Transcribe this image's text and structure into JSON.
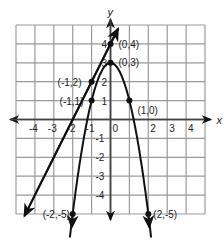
{
  "chart_data": {
    "type": "line",
    "title": "",
    "xlabel": "x",
    "ylabel": "y",
    "xlim": [
      -5,
      5
    ],
    "ylim": [
      -5,
      5
    ],
    "grid": true,
    "x_ticks": [
      "-4",
      "-3",
      "-2",
      "-1",
      "0",
      "2",
      "3",
      "4"
    ],
    "y_ticks": [
      "4",
      "3",
      "2",
      "1",
      "-1",
      "-2",
      "-3",
      "-4"
    ],
    "series": [
      {
        "name": "line",
        "equation": "y = 2x + 4",
        "points": [
          [
            0,
            4
          ],
          [
            -1,
            2
          ]
        ]
      },
      {
        "name": "parabola",
        "equation": "y = 3 - 2x^2",
        "points": [
          [
            0,
            3
          ],
          [
            -1,
            1
          ],
          [
            1,
            1
          ],
          [
            -2,
            -5
          ],
          [
            2,
            -5
          ]
        ]
      }
    ],
    "annotations": [
      "(0,4)",
      "(0,3)",
      "(-1,2)",
      "(-1,1)",
      "(1,0)",
      "(-2,-5)",
      "(2,-5)"
    ]
  }
}
